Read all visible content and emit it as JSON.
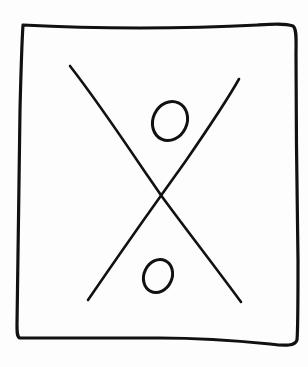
{
  "diagram": {
    "description": "Hand-drawn rectangular frame containing a large X with two small ovals, one in the upper wedge and one in the lower wedge",
    "style": "hand-drawn black ink on white",
    "colors": {
      "ink": "#111111",
      "background": "#fdfdfd"
    },
    "frame": {
      "shape": "rectangle",
      "corners": [
        [
          23,
          25
        ],
        [
          295,
          25
        ],
        [
          297,
          345
        ],
        [
          18,
          338
        ]
      ]
    },
    "cross": {
      "line_a": {
        "from": [
          70,
          66
        ],
        "to": [
          241,
          302
        ]
      },
      "line_b": {
        "from": [
          239,
          79
        ],
        "to": [
          88,
          300
        ]
      },
      "intersection": [
        161,
        196
      ]
    },
    "circles": [
      {
        "position": "upper",
        "center": [
          170,
          121
        ],
        "rx": 17,
        "ry": 20,
        "rotation": 25
      },
      {
        "position": "lower",
        "center": [
          158,
          276
        ],
        "rx": 14,
        "ry": 17,
        "rotation": 25
      }
    ]
  }
}
